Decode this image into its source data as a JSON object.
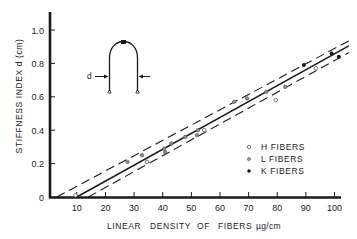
{
  "chart_data": {
    "type": "scatter",
    "title": "",
    "xlabel": "LINEAR DENSITY OF FIBERS µg/cm",
    "xlabel_parts": [
      "LINEAR",
      "DENSITY",
      "OF",
      "FIBERS",
      "µg/cm"
    ],
    "ylabel": "STIFFNESS INDEX d (cm)",
    "xlim": [
      0,
      105
    ],
    "ylim": [
      0,
      1.1
    ],
    "x_ticks": [
      10,
      20,
      30,
      40,
      50,
      60,
      70,
      80,
      90,
      100
    ],
    "x_tick_labels": [
      "10",
      "20",
      "30",
      "40",
      "50",
      "60",
      "70",
      "80",
      "90",
      "100"
    ],
    "y_ticks": [
      0,
      0.2,
      0.4,
      0.6,
      0.8,
      1.0
    ],
    "y_tick_labels": [
      "0",
      "0.2",
      "0.4",
      "0.6",
      "0.8",
      "1.0"
    ],
    "grid": false,
    "legend_position": "lower right (inside plot)",
    "series": [
      {
        "name": "H FIBERS",
        "label": "H FIBERS",
        "marker": "open-circle",
        "points": [
          [
            9.5,
            0.01
          ],
          [
            34.5,
            0.21
          ],
          [
            54.5,
            0.4
          ],
          [
            79.5,
            0.58
          ],
          [
            93.5,
            0.77
          ]
        ]
      },
      {
        "name": "L FIBERS",
        "label": "L FIBERS",
        "marker": "gray-circle",
        "points": [
          [
            27.7,
            0.21
          ],
          [
            32.8,
            0.25
          ],
          [
            40.5,
            0.29
          ],
          [
            40.8,
            0.27
          ],
          [
            43.0,
            0.32
          ],
          [
            47.9,
            0.36
          ],
          [
            52.0,
            0.37
          ],
          [
            52.3,
            0.4
          ],
          [
            65.0,
            0.57
          ],
          [
            69.5,
            0.59
          ],
          [
            76.2,
            0.63
          ],
          [
            82.8,
            0.66
          ]
        ]
      },
      {
        "name": "K FIBERS",
        "label": "K FIBERS",
        "marker": "filled-circle",
        "points": [
          [
            89.3,
            0.79
          ],
          [
            99.0,
            0.86
          ],
          [
            101.5,
            0.84
          ]
        ]
      }
    ],
    "fit_lines": [
      {
        "name": "regression",
        "style": "solid",
        "from": [
          10,
          0.0
        ],
        "to": [
          105,
          0.905
        ]
      },
      {
        "name": "upper-bound",
        "style": "dashed",
        "from": [
          3,
          0.0
        ],
        "to": [
          105,
          0.935
        ]
      },
      {
        "name": "lower-bound",
        "style": "dashed",
        "from": [
          14,
          0.0
        ],
        "to": [
          105,
          0.865
        ]
      }
    ],
    "inset": {
      "description": "fiber loop diagram with weight at apex",
      "d_label": "d"
    }
  },
  "colors": {
    "ink": "#1a1a1a",
    "gray_marker": "#8a8a8a",
    "background": "#ffffff"
  }
}
